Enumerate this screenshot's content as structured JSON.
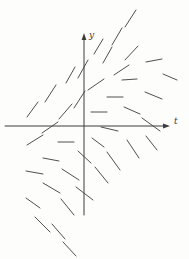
{
  "figure": {
    "width": 189,
    "height": 259,
    "background": "#fdfdfc",
    "ink": "#3c3c3c"
  },
  "chart_data": {
    "type": "line",
    "subtype": "direction-field",
    "title": "",
    "xlabel": "t",
    "ylabel": "y",
    "grid": false,
    "tick_labels": [],
    "axes": {
      "t_axis": {
        "y": 126,
        "x_start": 5,
        "x_end": 165,
        "arrow": "right"
      },
      "y_axis": {
        "x": 84,
        "y_top": 38,
        "y_bottom": 215,
        "arrow": "up"
      }
    },
    "segments_px": [
      [
        125,
        27,
        136,
        10
      ],
      [
        112,
        45,
        122,
        28
      ],
      [
        94,
        54,
        103,
        39
      ],
      [
        103,
        63,
        112,
        47
      ],
      [
        78,
        78,
        88,
        60
      ],
      [
        66,
        83,
        75,
        67
      ],
      [
        45,
        102,
        56,
        85
      ],
      [
        27,
        117,
        38,
        102
      ],
      [
        59,
        119,
        72,
        104
      ],
      [
        42,
        133,
        58,
        122
      ],
      [
        74,
        108,
        85,
        91
      ],
      [
        88,
        90,
        104,
        79
      ],
      [
        125,
        60,
        138,
        46
      ],
      [
        114,
        75,
        129,
        65
      ],
      [
        146,
        62,
        162,
        59
      ],
      [
        122,
        80,
        137,
        79
      ],
      [
        163,
        74,
        177,
        80
      ],
      [
        145,
        92,
        162,
        99
      ],
      [
        107,
        97,
        123,
        97
      ],
      [
        91,
        112,
        107,
        112
      ],
      [
        124,
        107,
        140,
        114
      ],
      [
        142,
        118,
        160,
        131
      ],
      [
        101,
        127,
        118,
        131
      ],
      [
        27,
        145,
        43,
        135
      ],
      [
        58,
        142,
        74,
        142
      ],
      [
        92,
        138,
        104,
        147
      ],
      [
        43,
        158,
        59,
        161
      ],
      [
        78,
        151,
        91,
        163
      ],
      [
        127,
        140,
        139,
        158
      ],
      [
        107,
        152,
        120,
        170
      ],
      [
        146,
        136,
        157,
        150
      ],
      [
        26,
        171,
        43,
        174
      ],
      [
        62,
        169,
        79,
        180
      ],
      [
        95,
        167,
        108,
        183
      ],
      [
        43,
        183,
        60,
        193
      ],
      [
        76,
        187,
        93,
        200
      ],
      [
        26,
        198,
        40,
        208
      ],
      [
        61,
        199,
        74,
        215
      ],
      [
        35,
        217,
        50,
        232
      ],
      [
        52,
        224,
        65,
        239
      ],
      [
        63,
        242,
        76,
        256
      ]
    ]
  }
}
